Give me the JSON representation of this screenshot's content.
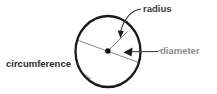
{
  "diagram": {
    "labels": {
      "radius": "radius",
      "diameter": "diameter",
      "circumference": "circumference"
    },
    "colors": {
      "background": "#ffffff",
      "circle_stroke": "#1a1a1a",
      "radius_line": "#7d7d7d",
      "diameter_line": "#8a8a8a",
      "center_dot": "#111111",
      "radius_label_text": "#3a3a3a",
      "diameter_label_text": "#8c8c8c",
      "circumference_label_text": "#2b2b2b",
      "leader_line": "#444444"
    },
    "geometry": {
      "center_x": 108,
      "center_y": 51,
      "radius_x": 33,
      "radius_y": 36,
      "circle_stroke_width": 2.2
    },
    "elements": [
      {
        "name": "circle-outline",
        "kind": "ellipse"
      },
      {
        "name": "center-point",
        "kind": "dot"
      },
      {
        "name": "radius-segment",
        "kind": "line"
      },
      {
        "name": "diameter-segment",
        "kind": "line"
      },
      {
        "name": "radius-leader",
        "kind": "curved-arrow"
      },
      {
        "name": "diameter-leader",
        "kind": "arrow"
      },
      {
        "name": "circumference-tick",
        "kind": "tick"
      }
    ]
  }
}
